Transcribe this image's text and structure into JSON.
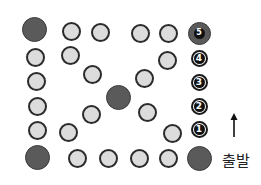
{
  "diagram": {
    "start_label": "출발",
    "arrow_direction": "up",
    "colors": {
      "small_fill": "#dcdcdc",
      "small_border": "#2b2b2b",
      "big_fill": "#5a5a5a",
      "marker_fill": "#111111",
      "marker_text": "#ffffff"
    },
    "numbered_markers": [
      {
        "label": "1",
        "x": 199,
        "y": 129
      },
      {
        "label": "2",
        "x": 199,
        "y": 106
      },
      {
        "label": "3",
        "x": 199,
        "y": 82
      },
      {
        "label": "4",
        "x": 199,
        "y": 58
      }
    ],
    "numbered_big_marker": {
      "label": "5",
      "x": 199,
      "y": 33
    },
    "big_circles": [
      {
        "x": 34,
        "y": 29
      },
      {
        "x": 118,
        "y": 97
      },
      {
        "x": 37,
        "y": 157
      },
      {
        "x": 199,
        "y": 158
      }
    ],
    "small_circles": [
      {
        "x": 71,
        "y": 31
      },
      {
        "x": 100,
        "y": 32
      },
      {
        "x": 140,
        "y": 33
      },
      {
        "x": 168,
        "y": 33
      },
      {
        "x": 35,
        "y": 57
      },
      {
        "x": 70,
        "y": 55
      },
      {
        "x": 167,
        "y": 60
      },
      {
        "x": 36,
        "y": 81
      },
      {
        "x": 92,
        "y": 74
      },
      {
        "x": 144,
        "y": 78
      },
      {
        "x": 37,
        "y": 106
      },
      {
        "x": 91,
        "y": 114
      },
      {
        "x": 147,
        "y": 112
      },
      {
        "x": 37,
        "y": 130
      },
      {
        "x": 68,
        "y": 132
      },
      {
        "x": 172,
        "y": 133
      },
      {
        "x": 77,
        "y": 158
      },
      {
        "x": 108,
        "y": 158
      },
      {
        "x": 139,
        "y": 158
      },
      {
        "x": 168,
        "y": 158
      }
    ]
  }
}
